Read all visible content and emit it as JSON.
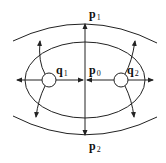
{
  "diagram": {
    "type": "geometric-schematic",
    "labels": {
      "p1": {
        "base": "p",
        "sub": "1"
      },
      "p0": {
        "base": "p",
        "sub": "0"
      },
      "p2": {
        "base": "p",
        "sub": "2"
      },
      "q1": {
        "base": "q",
        "sub": "1"
      },
      "q2": {
        "base": "q",
        "sub": "2"
      }
    },
    "colors": {
      "stroke": "#222222",
      "background": "#ffffff"
    }
  }
}
